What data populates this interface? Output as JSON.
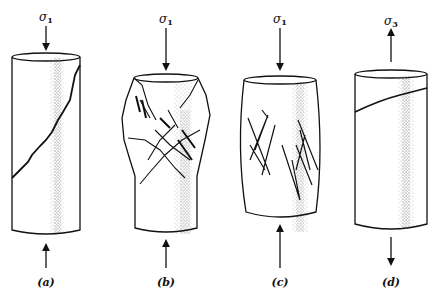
{
  "figure": {
    "panels": [
      {
        "id": "a",
        "label": "(a)",
        "stress_symbol": "σ",
        "stress_subscript": "1",
        "load": "compression",
        "failure": "single inclined shear fracture"
      },
      {
        "id": "b",
        "label": "(b)",
        "stress_symbol": "σ",
        "stress_subscript": "1",
        "load": "compression",
        "failure": "conjugate shear fractures, crushed upper part"
      },
      {
        "id": "c",
        "label": "(c)",
        "stress_symbol": "σ",
        "stress_subscript": "1",
        "load": "compression",
        "failure": "barreling with multiple conjugate shear bands"
      },
      {
        "id": "d",
        "label": "(d)",
        "stress_symbol": "σ",
        "stress_subscript": "3",
        "load": "tension",
        "failure": "tension fracture"
      }
    ],
    "colors": {
      "ink": "#111111",
      "stipple": "#555555",
      "background": "#ffffff"
    }
  }
}
